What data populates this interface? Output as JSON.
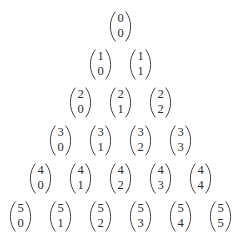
{
  "document": {
    "title": "Pascal's triangle of binomial coefficients",
    "background_color": "#ffffff",
    "text_color": "#2b2b2b",
    "notation": "binomial-coefficient",
    "row_count": 6
  },
  "rows": [
    {
      "n": "0",
      "entries": [
        {
          "n": "0",
          "k": "0"
        }
      ]
    },
    {
      "n": "1",
      "entries": [
        {
          "n": "1",
          "k": "0"
        },
        {
          "n": "1",
          "k": "1"
        }
      ]
    },
    {
      "n": "2",
      "entries": [
        {
          "n": "2",
          "k": "0"
        },
        {
          "n": "2",
          "k": "1"
        },
        {
          "n": "2",
          "k": "2"
        }
      ]
    },
    {
      "n": "3",
      "entries": [
        {
          "n": "3",
          "k": "0"
        },
        {
          "n": "3",
          "k": "1"
        },
        {
          "n": "3",
          "k": "2"
        },
        {
          "n": "3",
          "k": "3"
        }
      ]
    },
    {
      "n": "4",
      "entries": [
        {
          "n": "4",
          "k": "0"
        },
        {
          "n": "4",
          "k": "1"
        },
        {
          "n": "4",
          "k": "2"
        },
        {
          "n": "4",
          "k": "3"
        },
        {
          "n": "4",
          "k": "4"
        }
      ]
    },
    {
      "n": "5",
      "entries": [
        {
          "n": "5",
          "k": "0"
        },
        {
          "n": "5",
          "k": "1"
        },
        {
          "n": "5",
          "k": "2"
        },
        {
          "n": "5",
          "k": "3"
        },
        {
          "n": "5",
          "k": "4"
        },
        {
          "n": "5",
          "k": "5"
        }
      ]
    }
  ]
}
